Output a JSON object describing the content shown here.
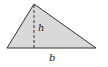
{
  "diagram": {
    "shape": "triangle",
    "fill_color": "#d9d9d9",
    "stroke_color": "#333333",
    "labels": {
      "height": "h",
      "base": "b"
    }
  }
}
